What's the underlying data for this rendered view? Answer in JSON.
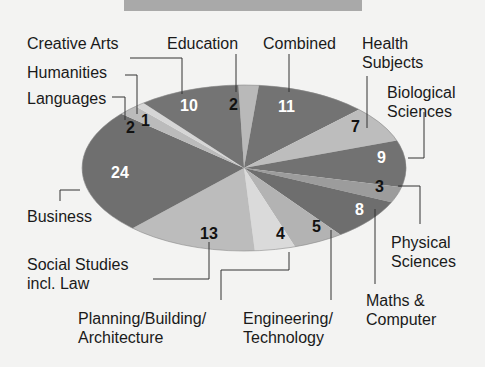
{
  "chart_data": {
    "type": "pie",
    "title": "",
    "start_category": "Education",
    "direction": "clockwise",
    "categories": [
      "Education",
      "Combined",
      "Health Subjects",
      "Biological Sciences",
      "Physical Sciences",
      "Maths & Computer",
      "Engineering/ Technology",
      "Planning/Building/ Architecture",
      "Social Studies incl. Law",
      "Business",
      "Languages",
      "Humanities",
      "Creative Arts"
    ],
    "values": [
      2,
      11,
      7,
      9,
      3,
      8,
      5,
      4,
      13,
      24,
      2,
      1,
      10
    ],
    "colors": [
      "#b9b9b9",
      "#737373",
      "#bdbdbd",
      "#727272",
      "#9c9c9c",
      "#6e6e6e",
      "#b3b3b3",
      "#dadada",
      "#bcbcbc",
      "#6f6f6f",
      "#bbbbbb",
      "#d6d6d6",
      "#747474"
    ],
    "value_label_colors": [
      "#111",
      "#fff",
      "#111",
      "#fff",
      "#111",
      "#fff",
      "#111",
      "#111",
      "#111",
      "#fff",
      "#111",
      "#111",
      "#fff"
    ]
  },
  "labels": {
    "creative_arts": "Creative Arts",
    "education": "Education",
    "combined": "Combined",
    "health_1": "Health",
    "health_2": "Subjects",
    "humanities": "Humanities",
    "biological_1": "Biological",
    "biological_2": "Sciences",
    "languages": "Languages",
    "business": "Business",
    "physical_1": "Physical",
    "physical_2": "Sciences",
    "social_1": "Social Studies",
    "social_2": "incl. Law",
    "maths_1": "Maths &",
    "maths_2": "Computer",
    "planning_1": "Planning/Building/",
    "planning_2": "Architecture",
    "engineering_1": "Engineering/",
    "engineering_2": "Technology"
  },
  "values_display": {
    "education": "2",
    "combined": "11",
    "health": "7",
    "biological": "9",
    "physical": "3",
    "maths": "8",
    "engineering": "5",
    "planning": "4",
    "social": "13",
    "business": "24",
    "languages": "2",
    "humanities": "1",
    "creative": "10"
  }
}
